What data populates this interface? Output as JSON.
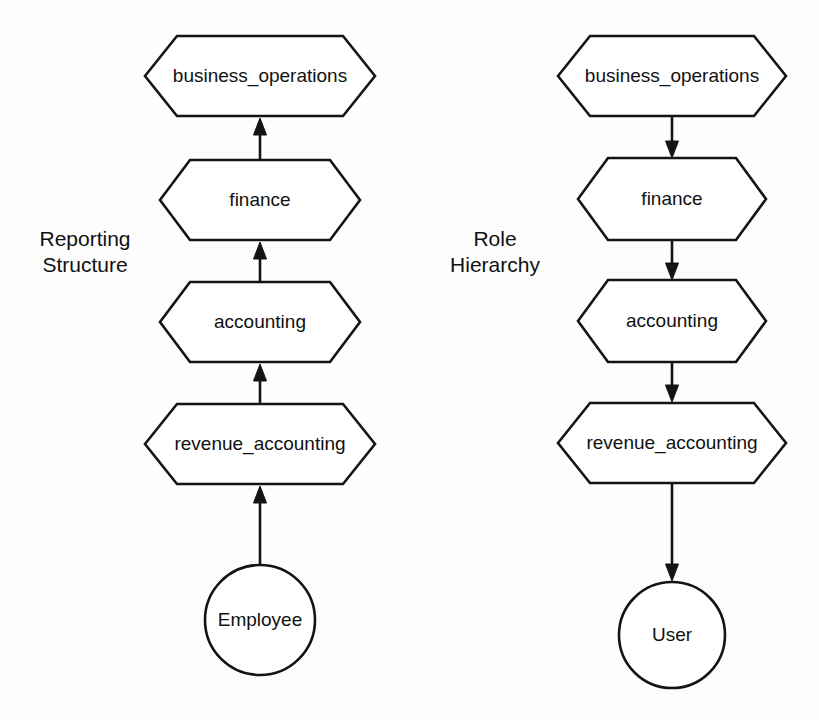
{
  "canvas": {
    "width": 819,
    "height": 720,
    "background_color": "#fdfdfd",
    "ink_color": "#141414"
  },
  "panels": [
    {
      "id": "reporting-structure",
      "caption_line1": "Reporting",
      "caption_line2": "Structure",
      "caption_x": 85,
      "caption_y1": 246,
      "caption_y2": 272,
      "edge_direction": "upward",
      "nodes": [
        {
          "id": "left-business-operations",
          "label": "business_operations",
          "shape": "hexagon",
          "cx": 260,
          "cy": 76,
          "half_width": 115,
          "half_height": 40,
          "notch": 32,
          "font_size": 19
        },
        {
          "id": "left-finance",
          "label": "finance",
          "shape": "hexagon",
          "cx": 260,
          "cy": 200,
          "half_width": 100,
          "half_height": 40,
          "notch": 30,
          "font_size": 19
        },
        {
          "id": "left-accounting",
          "label": "accounting",
          "shape": "hexagon",
          "cx": 260,
          "cy": 322,
          "half_width": 100,
          "half_height": 40,
          "notch": 30,
          "font_size": 19
        },
        {
          "id": "left-revenue-accounting",
          "label": "revenue_accounting",
          "shape": "hexagon",
          "cx": 260,
          "cy": 444,
          "half_width": 115,
          "half_height": 40,
          "notch": 32,
          "font_size": 19
        },
        {
          "id": "left-employee",
          "label": "Employee",
          "shape": "circle",
          "cx": 260,
          "cy": 620,
          "radius": 55,
          "font_size": 19
        }
      ],
      "edges": [
        {
          "id": "left-edge-finance-to-business-operations",
          "from": "left-finance",
          "to": "left-business-operations",
          "x": 260,
          "y_start": 160,
          "y_end": 118
        },
        {
          "id": "left-edge-accounting-to-finance",
          "from": "left-accounting",
          "to": "left-finance",
          "x": 260,
          "y_start": 282,
          "y_end": 242
        },
        {
          "id": "left-edge-revenue-to-accounting",
          "from": "left-revenue-accounting",
          "to": "left-accounting",
          "x": 260,
          "y_start": 404,
          "y_end": 364
        },
        {
          "id": "left-edge-employee-to-revenue",
          "from": "left-employee",
          "to": "left-revenue-accounting",
          "x": 260,
          "y_start": 565,
          "y_end": 486
        }
      ]
    },
    {
      "id": "role-hierarchy",
      "caption_line1": "Role",
      "caption_line2": "Hierarchy",
      "caption_x": 495,
      "caption_y1": 246,
      "caption_y2": 272,
      "edge_direction": "downward",
      "nodes": [
        {
          "id": "right-business-operations",
          "label": "business_operations",
          "shape": "hexagon",
          "cx": 672,
          "cy": 76,
          "half_width": 114,
          "half_height": 40,
          "notch": 32,
          "font_size": 19
        },
        {
          "id": "right-finance",
          "label": "finance",
          "shape": "hexagon",
          "cx": 672,
          "cy": 199,
          "half_width": 94,
          "half_height": 41,
          "notch": 30,
          "font_size": 19
        },
        {
          "id": "right-accounting",
          "label": "accounting",
          "shape": "hexagon",
          "cx": 672,
          "cy": 321,
          "half_width": 94,
          "half_height": 41,
          "notch": 30,
          "font_size": 19
        },
        {
          "id": "right-revenue-accounting",
          "label": "revenue_accounting",
          "shape": "hexagon",
          "cx": 672,
          "cy": 443,
          "half_width": 114,
          "half_height": 40,
          "notch": 32,
          "font_size": 19
        },
        {
          "id": "right-user",
          "label": "User",
          "shape": "circle",
          "cx": 672,
          "cy": 635,
          "radius": 53,
          "font_size": 19
        }
      ],
      "edges": [
        {
          "id": "right-edge-business-operations-to-finance",
          "from": "right-business-operations",
          "to": "right-finance",
          "x": 672,
          "y_start": 117,
          "y_end": 158
        },
        {
          "id": "right-edge-finance-to-accounting",
          "from": "right-finance",
          "to": "right-accounting",
          "x": 672,
          "y_start": 240,
          "y_end": 280
        },
        {
          "id": "right-edge-accounting-to-revenue",
          "from": "right-accounting",
          "to": "right-revenue-accounting",
          "x": 672,
          "y_start": 362,
          "y_end": 402
        },
        {
          "id": "right-edge-revenue-to-user",
          "from": "right-revenue-accounting",
          "to": "right-user",
          "x": 672,
          "y_start": 484,
          "y_end": 581
        }
      ]
    }
  ],
  "arrow_head": {
    "half_width": 6.5,
    "length": 17
  }
}
